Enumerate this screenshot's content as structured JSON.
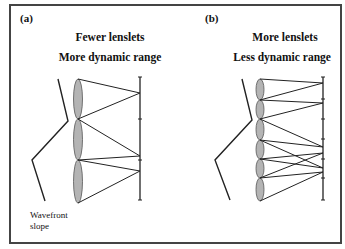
{
  "panels": [
    {
      "label": "(a)",
      "title_line1": "Fewer lenslets",
      "title_line2": "More dynamic range",
      "caption_line1": "Wavefront",
      "caption_line2": "slope",
      "lenslet_count": 3
    },
    {
      "label": "(b)",
      "title_line1": "More lenslets",
      "title_line2": "Less dynamic range",
      "lenslet_count": 6
    }
  ],
  "colors": {
    "frame": "#444444",
    "lens_fill": "#b4b4b4",
    "line": "#222222"
  }
}
